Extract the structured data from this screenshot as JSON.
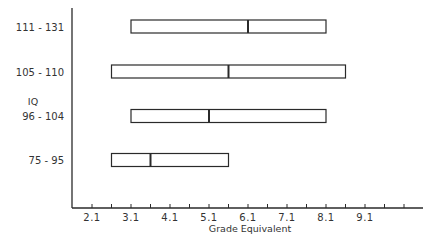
{
  "chart_data": {
    "type": "boxplot-range",
    "title": "",
    "xlabel": "Grade Equivalent",
    "ylabel": "IQ",
    "xlim": [
      1.6,
      11.1
    ],
    "x_ticks": [
      2.1,
      2.6,
      3.1,
      3.6,
      4.1,
      4.6,
      5.1,
      5.6,
      6.1,
      6.6,
      7.1,
      7.6,
      8.1,
      8.6,
      9.1,
      9.6,
      10.1
    ],
    "x_tick_labels": [
      "2.1",
      "3.1",
      "4.1",
      "5.1",
      "6.1",
      "7.1",
      "8.1",
      "9.1"
    ],
    "x_tick_label_values": [
      2.1,
      3.1,
      4.1,
      5.1,
      6.1,
      7.1,
      8.1,
      9.1
    ],
    "categories": [
      "111 - 131",
      "105 - 110",
      "96 - 104",
      "75 - 95"
    ],
    "series": [
      {
        "category": "111 - 131",
        "low": 3.1,
        "median": 6.1,
        "high": 8.1
      },
      {
        "category": "105 - 110",
        "low": 2.6,
        "median": 5.6,
        "high": 8.6
      },
      {
        "category": "96 - 104",
        "low": 3.1,
        "median": 5.1,
        "high": 8.1
      },
      {
        "category": "75 - 95",
        "low": 2.6,
        "median": 3.6,
        "high": 5.6
      }
    ],
    "grid": false,
    "legend": null
  },
  "colors": {
    "ink": "#2a2a2a",
    "background": "#ffffff"
  }
}
